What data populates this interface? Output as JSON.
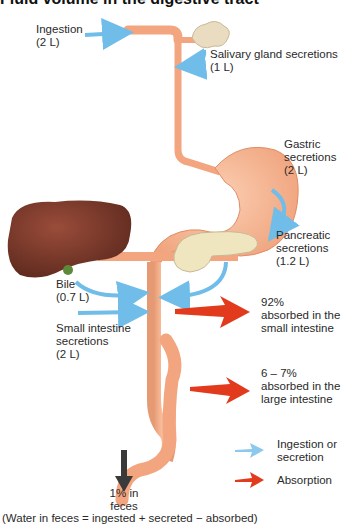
{
  "title": "Fluid volume in the digestive tract",
  "colors": {
    "tract": "#f2a57e",
    "tract_dark": "#e08c64",
    "liver": "#7a3a2c",
    "pancreas": "#efe5bf",
    "salivary": "#e8dcc0",
    "secretion_arrow": "#6fbde8",
    "absorption_arrow": "#e23a1c",
    "feces_arrow": "#333333"
  },
  "labels": {
    "ingestion": [
      "Ingestion",
      "(2 L)"
    ],
    "salivary": [
      "Salivary gland secretions",
      "(1 L)"
    ],
    "gastric": [
      "Gastric",
      "secretions",
      "(2 L)"
    ],
    "pancreatic": [
      "Pancreatic",
      "secretions",
      "(1.2 L)"
    ],
    "bile": [
      "Bile",
      "(0.7 L)"
    ],
    "small_intestine_secretions": [
      "Small intestine",
      "secretions",
      "(2 L)"
    ],
    "small_absorb": [
      "92%",
      "absorbed in the",
      "small intestine"
    ],
    "large_absorb": [
      "6 – 7%",
      "absorbed in the",
      "large intestine"
    ],
    "feces": [
      "1% in",
      "feces"
    ],
    "equation": "(Water in feces = ingested + secreted − absorbed)"
  },
  "legend": [
    {
      "label_lines": [
        "Ingestion or",
        "secretion"
      ],
      "arrow": "secretion-arrow-icon"
    },
    {
      "label_lines": [
        "Absorption"
      ],
      "arrow": "absorption-arrow-icon"
    }
  ]
}
